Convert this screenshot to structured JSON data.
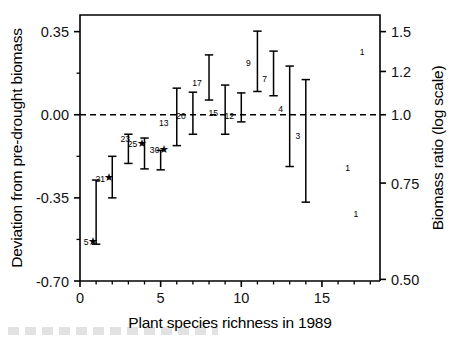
{
  "chart_data": {
    "type": "scatter",
    "title": "",
    "xlabel": "Plant species richness in 1989",
    "ylabel": "Deviation from pre-drought biomass",
    "y2label": "Biomass ratio (log scale)",
    "xlim": [
      0,
      18.6
    ],
    "ylim": [
      -0.7,
      0.42
    ],
    "grid": false,
    "legend": "none",
    "reference_line": {
      "y": 0.0,
      "style": "dashed"
    },
    "xticks": [
      0,
      5,
      10,
      15
    ],
    "xticklabels": [
      "0",
      "5",
      "10",
      "15"
    ],
    "xminor_step": 1,
    "yticks": [
      0.35,
      0.0,
      -0.35,
      -0.7
    ],
    "yticklabels": [
      "0.35",
      "0.00",
      "-0.35",
      "-0.70"
    ],
    "yminor": [
      0.175,
      -0.175,
      -0.525
    ],
    "y2ticks": [
      0.35,
      0.1823,
      0.0,
      -0.2877,
      -0.6931
    ],
    "y2ticklabels": [
      "1.5",
      "1.2",
      "1.0",
      "0.75",
      "0.50"
    ],
    "series": [
      {
        "name": "mean deviation with 95% CI",
        "points": [
          {
            "x": 1,
            "y": -0.355,
            "low": -0.545,
            "high": -0.275,
            "label": "5",
            "significant": true,
            "label_dx": -10,
            "label_dy": 46
          },
          {
            "x": 2,
            "y": -0.245,
            "low": -0.35,
            "high": -0.175,
            "label": "21",
            "significant": true,
            "label_dx": -12,
            "label_dy": 9
          },
          {
            "x": 3,
            "y": -0.15,
            "low": -0.205,
            "high": -0.082,
            "label": "23",
            "significant": false,
            "label_dx": -3,
            "label_dy": -8
          },
          {
            "x": 4,
            "y": -0.163,
            "low": -0.228,
            "high": -0.098,
            "label": "25",
            "significant": true,
            "label_dx": -12,
            "label_dy": -6
          },
          {
            "x": 5,
            "y": -0.195,
            "low": -0.232,
            "high": -0.15,
            "label": "30",
            "significant": true,
            "label_dx": -6,
            "label_dy": -8
          },
          {
            "x": 6,
            "y": -0.03,
            "low": -0.13,
            "high": 0.112,
            "label": "13",
            "significant": false,
            "label_dx": -13,
            "label_dy": 4
          },
          {
            "x": 7,
            "y": -0.002,
            "low": -0.082,
            "high": 0.095,
            "label": "20",
            "significant": false,
            "label_dx": -12,
            "label_dy": 4
          },
          {
            "x": 8,
            "y": 0.148,
            "low": 0.062,
            "high": 0.252,
            "label": "17",
            "significant": false,
            "label_dx": -12,
            "label_dy": 6
          },
          {
            "x": 9,
            "y": 0.01,
            "low": -0.082,
            "high": 0.125,
            "label": "15",
            "significant": false,
            "label_dx": -12,
            "label_dy": 4
          },
          {
            "x": 10,
            "y": -0.008,
            "low": -0.03,
            "high": 0.092,
            "label": "12",
            "significant": false,
            "label_dx": -12,
            "label_dy": 2
          },
          {
            "x": 11,
            "y": 0.222,
            "low": 0.098,
            "high": 0.352,
            "label": "9",
            "significant": false,
            "label_dx": -9,
            "label_dy": 4
          },
          {
            "x": 12,
            "y": 0.162,
            "low": 0.08,
            "high": 0.268,
            "label": "7",
            "significant": false,
            "label_dx": -9,
            "label_dy": 6
          },
          {
            "x": 13,
            "y": 0.005,
            "low": -0.218,
            "high": 0.205,
            "label": "4",
            "significant": false,
            "label_dx": -9,
            "label_dy": -2
          },
          {
            "x": 14,
            "y": -0.085,
            "low": -0.368,
            "high": 0.148,
            "label": "3",
            "significant": false,
            "label_dx": -8,
            "label_dy": 4
          }
        ]
      },
      {
        "name": "single-plot observations (n = 1)",
        "points": [
          {
            "x": 17.5,
            "y": 0.252,
            "label": "1",
            "significant": false
          },
          {
            "x": 16.6,
            "y": -0.235,
            "label": "1",
            "significant": false
          },
          {
            "x": 17.1,
            "y": -0.43,
            "label": "1",
            "significant": false
          }
        ]
      }
    ],
    "annotations": [
      {
        "text": "★",
        "meaning": "asterisk marks significant deviation",
        "applies_to": [
          "5",
          "21",
          "25",
          "30"
        ]
      }
    ]
  },
  "figure": {
    "xlabel": "Plant species richness in 1989",
    "ylabel": "Deviation from pre-drought biomass",
    "y2label": "Biomass ratio (log scale)"
  }
}
